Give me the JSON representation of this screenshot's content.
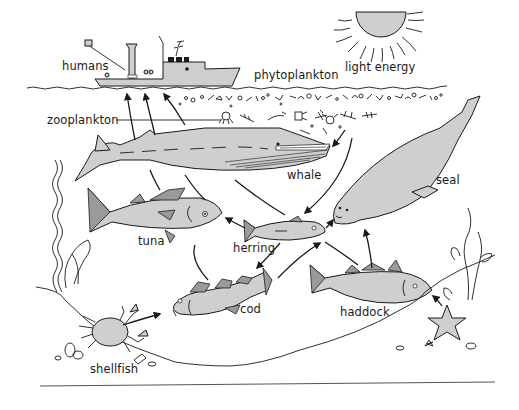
{
  "diagram": {
    "type": "marine food web",
    "colors": {
      "background": "#ffffff",
      "line": "#1a1a1a",
      "organism_fill": "#cfcfcf",
      "fin_fill": "#9a9a9a"
    },
    "labels": {
      "humans": "humans",
      "phytoplankton": "phytoplankton",
      "light_energy": "light energy",
      "zooplankton": "zooplankton",
      "whale": "whale",
      "seal": "seal",
      "tuna": "tuna",
      "herring": "herring",
      "cod": "cod",
      "haddock": "haddock",
      "shellfish": "shellfish"
    },
    "nodes": [
      {
        "id": "sun",
        "label": "light energy",
        "icon": "sun-icon"
      },
      {
        "id": "phytoplankton",
        "label": "phytoplankton"
      },
      {
        "id": "zooplankton",
        "label": "zooplankton"
      },
      {
        "id": "humans",
        "label": "humans",
        "icon": "fishing-boat-icon"
      },
      {
        "id": "whale",
        "label": "whale"
      },
      {
        "id": "seal",
        "label": "seal"
      },
      {
        "id": "tuna",
        "label": "tuna"
      },
      {
        "id": "herring",
        "label": "herring"
      },
      {
        "id": "cod",
        "label": "cod"
      },
      {
        "id": "haddock",
        "label": "haddock"
      },
      {
        "id": "shellfish",
        "label": "shellfish",
        "icon": "crab-icon"
      }
    ],
    "edges": [
      {
        "from": "zooplankton",
        "to": "whale"
      },
      {
        "from": "zooplankton",
        "to": "herring"
      },
      {
        "from": "herring",
        "to": "tuna"
      },
      {
        "from": "herring",
        "to": "seal"
      },
      {
        "from": "herring",
        "to": "cod"
      },
      {
        "from": "cod",
        "to": "seal"
      },
      {
        "from": "haddock",
        "to": "seal"
      },
      {
        "from": "shellfish",
        "to": "cod"
      },
      {
        "from": "starfish",
        "to": "haddock"
      },
      {
        "from": "whale",
        "to": "humans"
      },
      {
        "from": "tuna",
        "to": "humans"
      },
      {
        "from": "cod",
        "to": "humans"
      }
    ]
  }
}
